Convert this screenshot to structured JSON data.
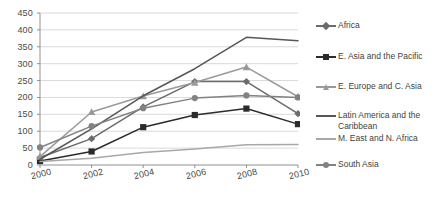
{
  "chart_data": {
    "type": "line",
    "title": "",
    "subtitle": "",
    "xlabel": "",
    "ylabel": "",
    "x": [
      2000,
      2002,
      2004,
      2006,
      2008,
      2010
    ],
    "categories": [
      "2000",
      "2002",
      "2004",
      "2006",
      "2008",
      "2010"
    ],
    "xlim": [
      2000,
      2010
    ],
    "ylim": [
      0,
      450
    ],
    "ytick_values": [
      0,
      50,
      100,
      150,
      200,
      250,
      300,
      350,
      400,
      450
    ],
    "ytick_labels": [
      "0",
      "50",
      "100",
      "150",
      "200",
      "250",
      "300",
      "350",
      "400",
      "450"
    ],
    "xtick_labels": [
      "2000",
      "2002",
      "2004",
      "2006",
      "2008",
      "2010"
    ],
    "grid": "horizontal",
    "legend_position": "right",
    "series": [
      {
        "name": "Africa",
        "marker": "diamond",
        "color": "#6b6b6b",
        "values": [
          22,
          78,
          172,
          247,
          247,
          152
        ]
      },
      {
        "name": "E. Asia and the Pacific",
        "marker": "square",
        "color": "#2b2b2b",
        "values": [
          12,
          40,
          112,
          148,
          167,
          121
        ]
      },
      {
        "name": "E. Europe and C. Asia",
        "marker": "triangle",
        "color": "#9a9a9a",
        "values": [
          25,
          157,
          204,
          244,
          290,
          202
        ]
      },
      {
        "name": "Latin America and the Caribbean",
        "marker": "none",
        "color": "#575757",
        "values": [
          17,
          107,
          205,
          285,
          378,
          368
        ]
      },
      {
        "name": "M. East and N. Africa",
        "marker": "none",
        "color": "#a8a8a8",
        "values": [
          10,
          20,
          37,
          47,
          60,
          61
        ]
      },
      {
        "name": "South Asia",
        "marker": "circle",
        "color": "#828282",
        "values": [
          52,
          115,
          168,
          198,
          206,
          200
        ]
      }
    ]
  },
  "legend": {
    "items": [
      {
        "label": "Africa"
      },
      {
        "label": "E. Asia and the Pacific"
      },
      {
        "label": "E. Europe and C. Asia"
      },
      {
        "label": "Latin America and the Caribbean"
      },
      {
        "label": "M. East and N. Africa"
      },
      {
        "label": "South Asia"
      }
    ]
  },
  "axes": {
    "y_axis_name": "y-axis",
    "x_axis_name": "x-axis"
  }
}
